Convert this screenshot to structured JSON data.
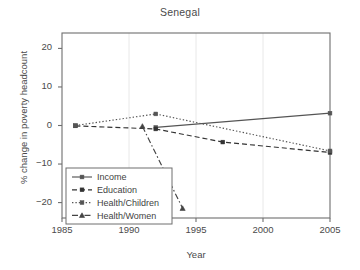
{
  "chart_data": {
    "type": "line",
    "title": "Senegal",
    "xlabel": "Year",
    "ylabel": "% change in poverty headcount",
    "xlim": [
      1985,
      2005
    ],
    "ylim": [
      -24,
      24
    ],
    "xticks": [
      1985,
      1990,
      1995,
      2000,
      2005
    ],
    "xtick_labels": [
      "1985",
      "1990",
      "1995",
      "2000",
      "2005"
    ],
    "yticks": [
      20,
      10,
      0,
      -10,
      -20
    ],
    "ytick_labels": [
      "20",
      "10",
      "0",
      "−10",
      "−20"
    ],
    "grid": "vertical-faint",
    "legend_position": "lower-left",
    "series": [
      {
        "name": "Income",
        "style": "solid",
        "marker": "square",
        "color": "#555555",
        "points": [
          {
            "x": 1992,
            "y": -0.5
          },
          {
            "x": 2005,
            "y": 3.2
          }
        ]
      },
      {
        "name": "Education",
        "style": "dashed",
        "marker": "square",
        "color": "#333333",
        "points": [
          {
            "x": 1986,
            "y": -0.1
          },
          {
            "x": 1992,
            "y": -0.9
          },
          {
            "x": 1997,
            "y": -4.3
          },
          {
            "x": 2005,
            "y": -7.0
          }
        ]
      },
      {
        "name": "Health/Children",
        "style": "dotted",
        "marker": "square",
        "color": "#555555",
        "points": [
          {
            "x": 1986,
            "y": 0.0
          },
          {
            "x": 1992,
            "y": 3.0
          },
          {
            "x": 2005,
            "y": -6.6
          }
        ]
      },
      {
        "name": "Health/Women",
        "style": "dashdot",
        "marker": "triangle",
        "color": "#444444",
        "points": [
          {
            "x": 1991,
            "y": -0.2
          },
          {
            "x": 1994,
            "y": -21.5
          }
        ]
      }
    ]
  },
  "legend": {
    "entries": [
      {
        "label": "Income"
      },
      {
        "label": "Education"
      },
      {
        "label": "Health/Children"
      },
      {
        "label": "Health/Women"
      }
    ]
  }
}
